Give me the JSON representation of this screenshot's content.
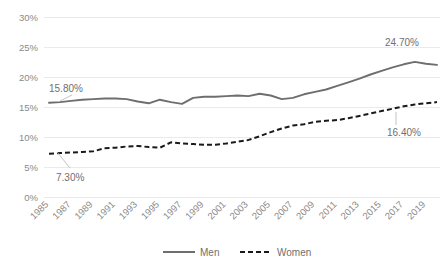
{
  "chart_data": {
    "type": "line",
    "title": "",
    "subtitle": "",
    "xlabel": "",
    "ylabel": "",
    "grid": true,
    "legend_position": "bottom",
    "ylim": [
      0,
      30
    ],
    "yticks": [
      0,
      5,
      10,
      15,
      20,
      25,
      30
    ],
    "ytick_labels": [
      "0%",
      "5%",
      "10%",
      "15%",
      "20%",
      "25%",
      "30%"
    ],
    "x": [
      1985,
      1986,
      1987,
      1988,
      1989,
      1990,
      1991,
      1992,
      1993,
      1994,
      1995,
      1996,
      1997,
      1998,
      1999,
      2000,
      2001,
      2002,
      2003,
      2004,
      2005,
      2006,
      2007,
      2008,
      2009,
      2010,
      2011,
      2012,
      2013,
      2014,
      2015,
      2016,
      2017,
      2018,
      2019,
      2020
    ],
    "xtick_labels": [
      "1985",
      "1987",
      "1989",
      "1991",
      "1993",
      "1995",
      "1997",
      "1999",
      "2001",
      "2003",
      "2005",
      "2007",
      "2009",
      "2011",
      "2013",
      "2015",
      "2017",
      "2019"
    ],
    "series": [
      {
        "name": "Men",
        "style": "solid",
        "color": "#6e6e6e",
        "values": [
          15.8,
          15.9,
          16.1,
          16.3,
          16.4,
          16.5,
          16.5,
          16.4,
          16.0,
          15.7,
          16.3,
          15.9,
          15.6,
          16.6,
          16.8,
          16.8,
          16.9,
          17.0,
          16.9,
          17.3,
          17.0,
          16.4,
          16.6,
          17.2,
          17.6,
          18.0,
          18.6,
          19.2,
          19.8,
          20.5,
          21.1,
          21.7,
          22.2,
          22.6,
          22.3,
          22.1
        ]
      },
      {
        "name": "Women",
        "style": "dashed",
        "color": "#1a1a1a",
        "values": [
          7.3,
          7.4,
          7.5,
          7.6,
          7.7,
          8.2,
          8.3,
          8.5,
          8.6,
          8.4,
          8.3,
          9.2,
          9.0,
          8.9,
          8.8,
          8.8,
          9.0,
          9.3,
          9.6,
          10.2,
          10.9,
          11.5,
          12.0,
          12.2,
          12.6,
          12.8,
          12.9,
          13.2,
          13.6,
          14.0,
          14.4,
          14.8,
          15.2,
          15.5,
          15.7,
          15.9
        ]
      }
    ],
    "annotations": [
      {
        "name": "men-start-label",
        "text": "15.80%",
        "series": "Men",
        "x": 1985,
        "value": 15.8
      },
      {
        "name": "women-start-label",
        "text": "7.30%",
        "series": "Women",
        "x": 1985,
        "value": 7.3
      },
      {
        "name": "men-end-label",
        "text": "24.70%",
        "series": "Men",
        "x": 2020,
        "value": 24.7
      },
      {
        "name": "women-end-label",
        "text": "16.40%",
        "series": "Women",
        "x": 2020,
        "value": 16.4
      }
    ],
    "legend": [
      {
        "label": "Men",
        "style": "solid",
        "color": "#6e6e6e"
      },
      {
        "label": "Women",
        "style": "dashed",
        "color": "#1a1a1a"
      }
    ]
  }
}
